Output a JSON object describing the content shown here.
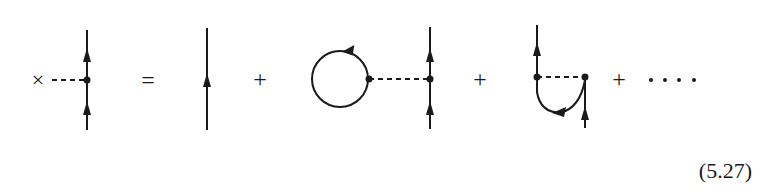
{
  "equation": {
    "number": "(5.27)",
    "operators": {
      "source": "×",
      "equals": "=",
      "plus": "+",
      "ellipsis": "...."
    },
    "terms": [
      {
        "id": "lhs",
        "description": "Full propagator with external source insertion"
      },
      {
        "id": "term-1",
        "description": "Bare propagator line"
      },
      {
        "id": "term-2",
        "description": "Tadpole loop attached by dashed interaction line"
      },
      {
        "id": "term-3",
        "description": "Exchange (Fock) diagram with dashed interaction line"
      }
    ]
  },
  "colors": {
    "ink": "#1a1a1a",
    "background": "#ffffff"
  }
}
